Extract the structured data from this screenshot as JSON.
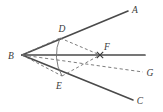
{
  "figure": {
    "background": "#ffffff",
    "stroke_solid": "#4a4a4a",
    "stroke_dashed": "#6e6e6e",
    "label_color": "#3a3a3a",
    "points": {
      "B": {
        "label": "B",
        "x": 22,
        "y": 55,
        "text_x": 11,
        "text_y": 59
      },
      "A": {
        "label": "A",
        "x": 128,
        "y": 11,
        "text_x": 134,
        "text_y": 12
      },
      "C": {
        "label": "C",
        "x": 133,
        "y": 100,
        "text_x": 139,
        "text_y": 104
      },
      "D": {
        "label": "D",
        "x": 60,
        "y": 38,
        "text_x": 61,
        "text_y": 32
      },
      "E": {
        "label": "E",
        "x": 62,
        "y": 76,
        "text_x": 58,
        "text_y": 89
      },
      "F": {
        "label": "F",
        "x": 100,
        "y": 55,
        "text_x": 105,
        "text_y": 50
      },
      "G": {
        "label": "G",
        "x": 143,
        "y": 72,
        "text_x": 148,
        "text_y": 76
      },
      "H": {
        "label": "",
        "x": 145,
        "y": 55,
        "text_x": 0,
        "text_y": 0
      }
    },
    "segments": [
      {
        "name": "ray-B-to-A",
        "style": "solid",
        "from": "B",
        "to": "A"
      },
      {
        "name": "ray-B-to-C",
        "style": "solid",
        "from": "B",
        "to": "C"
      },
      {
        "name": "ray-B-to-right",
        "style": "solid",
        "from": "B",
        "to": "H"
      },
      {
        "name": "segment-D-to-F",
        "style": "dashed",
        "from": "D",
        "to": "F"
      },
      {
        "name": "segment-B-to-D",
        "style": "dashed",
        "from": "B",
        "to": "D"
      },
      {
        "name": "segment-E-to-F",
        "style": "dashed",
        "from": "E",
        "to": "F"
      },
      {
        "name": "segment-B-to-E",
        "style": "dashed",
        "from": "B",
        "to": "E"
      },
      {
        "name": "ray-B-to-G",
        "style": "dashed",
        "from": "B",
        "to": "G"
      }
    ],
    "arc": {
      "name": "arc-D-to-E",
      "from": "D",
      "to": "E",
      "radius": 42
    },
    "marker": {
      "name": "intersection-mark-F",
      "shape": "x-cross",
      "x": 100,
      "y": 55,
      "size": 3.2
    }
  }
}
